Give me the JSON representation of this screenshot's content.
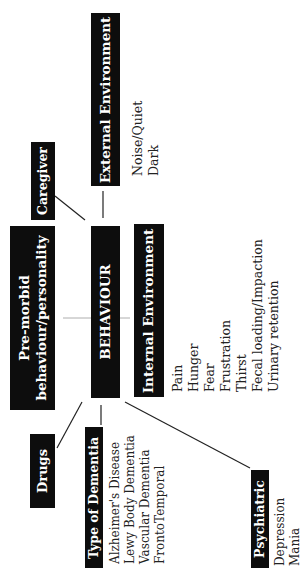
{
  "center": {
    "label": "BEHAVIOUR"
  },
  "nodes": {
    "external_environment": {
      "label": "External Environment",
      "items": [
        "Noise/Quiet",
        "Dark"
      ]
    },
    "caregiver": {
      "label": "Caregiver"
    },
    "premorbid": {
      "label_line1": "Pre-morbid",
      "label_line2": "behaviour/personality"
    },
    "internal_environment": {
      "label": "Internal Environment",
      "items": [
        "Pain",
        "Hunger",
        "Fear",
        "Frustration",
        "Thirst",
        "Fecal loading/Impaction",
        "Urinary retention"
      ]
    },
    "drugs": {
      "label": "Drugs"
    },
    "type_of_dementia": {
      "label": "Type of Dementia",
      "items": [
        "Alzheimer's Disease",
        "Lewy Body Dementia",
        "Vascular Dementia",
        "FrontoTemporal"
      ]
    },
    "psychiatric": {
      "label": "Psychiatric",
      "items": [
        "Depression",
        "Mania"
      ]
    }
  }
}
